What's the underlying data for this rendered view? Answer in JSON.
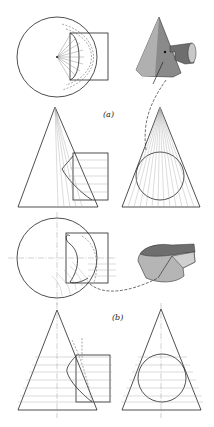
{
  "figure": {
    "parts": [
      {
        "label": "(a)",
        "views": [
          "top-view",
          "pictorial-view",
          "front-view",
          "side-view"
        ]
      },
      {
        "label": "(b)",
        "views": [
          "top-view",
          "pictorial-view",
          "front-view",
          "side-view"
        ]
      }
    ]
  },
  "labels": {
    "part_a": "(a)",
    "part_b": "(b)"
  },
  "colors": {
    "line": "#222222",
    "shade_dark": "#6e6e6e",
    "shade_mid": "#9a9a9a",
    "shade_light": "#c8c8c8",
    "background": "#ffffff"
  }
}
